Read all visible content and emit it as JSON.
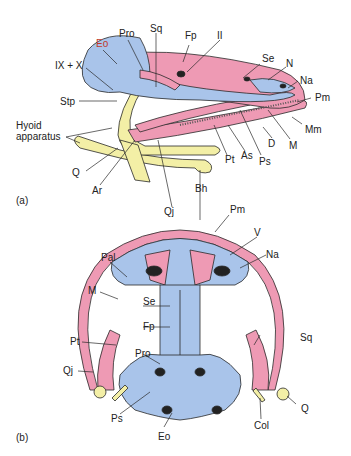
{
  "figure": {
    "colors": {
      "dermal_bone": "#ee9ab4",
      "endochondral_bone": "#a9c4ea",
      "cartilage_hyoid": "#f3efa6",
      "outline": "#2a2a2a"
    }
  },
  "panel_a": {
    "tag": "(a)",
    "labels": {
      "eo": "Eo",
      "pro": "Pro",
      "sq": "Sq",
      "fp": "Fp",
      "ii": "II",
      "ix_x": "IX + X",
      "stp": "Stp",
      "se": "Se",
      "n": "N",
      "na": "Na",
      "pm": "Pm",
      "hyoid": "Hyoid",
      "hyoid2": "apparatus",
      "q": "Q",
      "ar": "Ar",
      "qj": "Qj",
      "bh": "Bh",
      "pt": "Pt",
      "as": "As",
      "ps": "Ps",
      "d": "D",
      "m": "M",
      "mm": "Mm"
    }
  },
  "panel_b": {
    "tag": "(b)",
    "labels": {
      "pm": "Pm",
      "v": "V",
      "na": "Na",
      "pal": "Pal",
      "m": "M",
      "se": "Se",
      "fp": "Fp",
      "pt": "Pt",
      "sq": "Sq",
      "pro": "Pro",
      "qj": "Qj",
      "ps": "Ps",
      "eo": "Eo",
      "col": "Col",
      "q": "Q"
    }
  }
}
